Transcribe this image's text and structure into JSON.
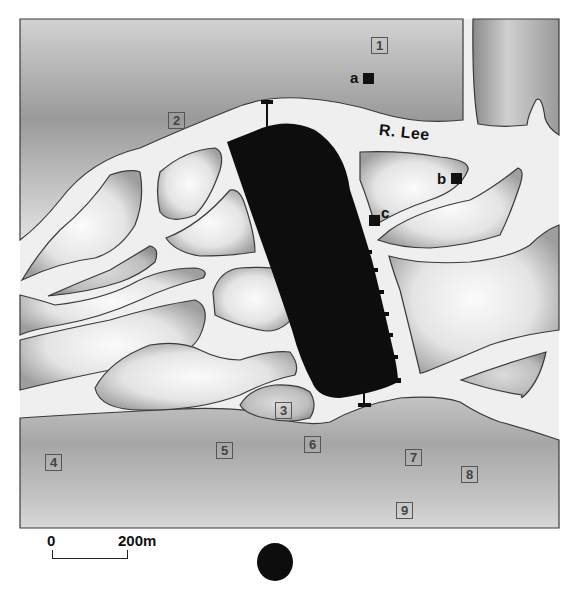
{
  "map": {
    "river": {
      "name": "R. Lee"
    },
    "numbered_sites": [
      {
        "id": "1",
        "label": "1"
      },
      {
        "id": "2",
        "label": "2"
      },
      {
        "id": "3",
        "label": "3"
      },
      {
        "id": "4",
        "label": "4"
      },
      {
        "id": "5",
        "label": "5"
      },
      {
        "id": "6",
        "label": "6"
      },
      {
        "id": "7",
        "label": "7"
      },
      {
        "id": "8",
        "label": "8"
      },
      {
        "id": "9",
        "label": "9"
      }
    ],
    "lettered_sites": [
      {
        "id": "a",
        "label": "a"
      },
      {
        "id": "b",
        "label": "b"
      },
      {
        "id": "c",
        "label": "c"
      }
    ],
    "walled_town": {
      "fill": "#0d0d0d"
    },
    "colors": {
      "water": "#efefef",
      "shoreline": "#3a3a3a",
      "land_dark": "#8c8c8c",
      "land_light": "#f4f4f4",
      "wall": "#0d0d0d"
    }
  },
  "scale": {
    "start_label": "0",
    "end_label": "200m"
  },
  "legend": {
    "symbol": "black-dot"
  }
}
